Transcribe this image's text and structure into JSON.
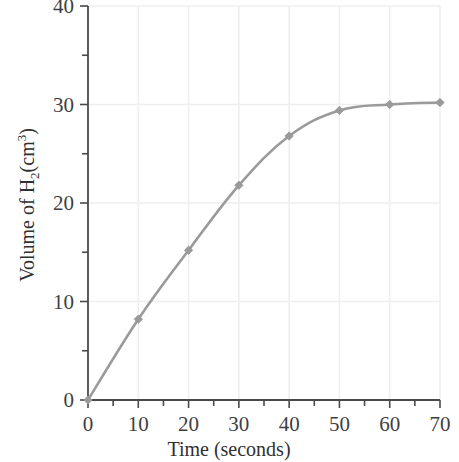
{
  "chart_data": {
    "type": "line",
    "title": "",
    "subtitle": "",
    "xlabel": "Time (seconds)",
    "ylabel": "Volume of H2(cm3)",
    "ylabel_parts": {
      "lead": "Volume of H",
      "sub": "2",
      "mid": "(cm",
      "sup": "3",
      "tail": ")"
    },
    "x": [
      0,
      10,
      20,
      30,
      40,
      50,
      60,
      70
    ],
    "values": [
      0,
      8.2,
      15.2,
      21.8,
      26.8,
      29.4,
      30.0,
      30.2
    ],
    "series": [
      {
        "name": "Volume of H2 evolved",
        "values": [
          0,
          8.2,
          15.2,
          21.8,
          26.8,
          29.4,
          30.0,
          30.2
        ]
      }
    ],
    "xlim": [
      0,
      70
    ],
    "ylim": [
      0,
      40
    ],
    "xticks": [
      0,
      10,
      20,
      30,
      40,
      50,
      60,
      70
    ],
    "yticks": [
      0,
      10,
      20,
      30,
      40
    ],
    "x_minor_ticks": [
      5,
      15,
      25,
      35,
      45,
      55,
      65
    ],
    "y_minor_ticks": [
      5,
      15,
      25,
      35
    ],
    "xtick_labels": [
      "0",
      "10",
      "20",
      "30",
      "40",
      "50",
      "60",
      "70"
    ],
    "ytick_labels": [
      "0",
      "10",
      "20",
      "30",
      "40"
    ],
    "grid": true,
    "legend": "none",
    "markers": "diamond",
    "colors": {
      "line": "#9a9a9a",
      "marker": "#9a9a9a",
      "axis": "#4a4a4a",
      "grid": "#efefef",
      "background": "#ffffff",
      "text": "#3a3a3a"
    }
  }
}
